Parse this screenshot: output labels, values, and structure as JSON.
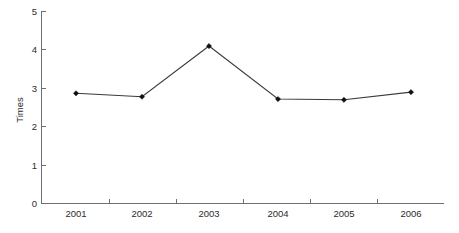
{
  "chart_data": {
    "type": "line",
    "title": "",
    "subtitle": "",
    "xlabel": "",
    "ylabel": "Times",
    "categories": [
      "2001",
      "2002",
      "2003",
      "2004",
      "2005",
      "2006"
    ],
    "values": [
      2.87,
      2.78,
      4.1,
      2.72,
      2.7,
      2.9
    ],
    "series": [
      {
        "name": "Times",
        "values": [
          2.87,
          2.78,
          4.1,
          2.72,
          2.7,
          2.9
        ]
      }
    ],
    "ylim": [
      0,
      5
    ],
    "y_ticks": [
      "0",
      "1",
      "2",
      "3",
      "4",
      "5"
    ],
    "x_tick_labels": [
      "2001",
      "2002",
      "2003",
      "2004",
      "2005",
      "2006"
    ],
    "grid": false,
    "legend": false,
    "legend_position": "none",
    "marker": "diamond",
    "line_color": "#3a3a3a",
    "marker_color": "#111111",
    "axis_color": "#6f6f6f",
    "background_color": "#ffffff"
  },
  "axes": {
    "y_axis_title": "Times",
    "y_tick_labels": [
      "5",
      "4",
      "3",
      "2",
      "1",
      "0"
    ],
    "x_tick_labels": [
      "2001",
      "2002",
      "2003",
      "2004",
      "2005",
      "2006"
    ]
  }
}
